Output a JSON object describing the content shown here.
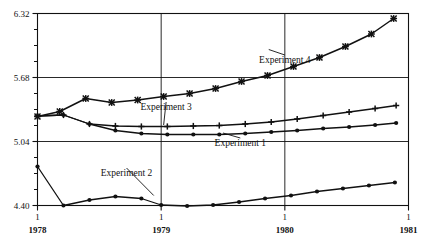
{
  "chart_data": {
    "type": "line",
    "title": "",
    "subtitle": "",
    "xlabel": "",
    "ylabel": "",
    "xlim": [
      1978.0,
      1981.0
    ],
    "ylim": [
      4.4,
      6.32
    ],
    "grid": true,
    "legend_position": "inline-annotations",
    "y_ticks_major": [
      "4.40",
      "5.04",
      "5.68",
      "6.32"
    ],
    "y_tick_values": [
      4.4,
      5.04,
      5.68,
      6.32
    ],
    "y_minor_step": 0.16,
    "x_ticks_major": [
      1978,
      1979,
      1980,
      1981
    ],
    "x_tick_top_label": "1",
    "x_tick_labels": [
      "1978",
      "1979",
      "1980",
      "1981"
    ],
    "series": [
      {
        "name": "Experiment 1",
        "marker": "filled-circle",
        "label_x": 1979.64,
        "label_y": 5.0,
        "anchor_x": 1979.5,
        "anchor_y": 5.125,
        "x": [
          1978.0,
          1978.21,
          1978.42,
          1978.63,
          1978.84,
          1979.05,
          1979.26,
          1979.47,
          1979.68,
          1979.89,
          1980.1,
          1980.31,
          1980.52,
          1980.73,
          1980.9
        ],
        "y": [
          5.295,
          5.305,
          5.215,
          5.15,
          5.12,
          5.11,
          5.11,
          5.11,
          5.12,
          5.135,
          5.15,
          5.17,
          5.185,
          5.205,
          5.225
        ]
      },
      {
        "name": "Experiment 2",
        "marker": "filled-circle",
        "label_x": 1978.72,
        "label_y": 4.7,
        "anchor_x": 1978.94,
        "anchor_y": 4.5,
        "x": [
          1978.0,
          1978.21,
          1978.42,
          1978.63,
          1978.84,
          1979.0,
          1979.21,
          1979.42,
          1979.63,
          1979.84,
          1980.05,
          1980.26,
          1980.47,
          1980.68,
          1980.89
        ],
        "y": [
          4.79,
          4.4,
          4.455,
          4.49,
          4.47,
          4.405,
          4.395,
          4.405,
          4.435,
          4.47,
          4.5,
          4.54,
          4.57,
          4.6,
          4.63
        ]
      },
      {
        "name": "Experiment 3",
        "marker": "plus",
        "label_x": 1979.04,
        "label_y": 5.36,
        "anchor_x": 1979.02,
        "anchor_y": 5.205,
        "x": [
          1978.0,
          1978.21,
          1978.42,
          1978.63,
          1978.84,
          1979.05,
          1979.26,
          1979.47,
          1979.68,
          1979.89,
          1980.1,
          1980.31,
          1980.52,
          1980.73,
          1980.9
        ],
        "y": [
          5.295,
          5.305,
          5.215,
          5.195,
          5.19,
          5.19,
          5.195,
          5.2,
          5.215,
          5.235,
          5.265,
          5.3,
          5.335,
          5.37,
          5.4
        ]
      },
      {
        "name": "Experiment 4",
        "marker": "cross",
        "label_x": 1980.0,
        "label_y": 5.83,
        "anchor_x": 1979.87,
        "anchor_y": 5.96,
        "x": [
          1978.0,
          1978.18,
          1978.39,
          1978.6,
          1978.81,
          1979.02,
          1979.23,
          1979.44,
          1979.65,
          1979.86,
          1980.07,
          1980.28,
          1980.49,
          1980.7,
          1980.88
        ],
        "y": [
          5.29,
          5.34,
          5.47,
          5.43,
          5.455,
          5.49,
          5.52,
          5.57,
          5.64,
          5.7,
          5.79,
          5.88,
          5.99,
          6.115,
          6.27
        ]
      }
    ]
  }
}
